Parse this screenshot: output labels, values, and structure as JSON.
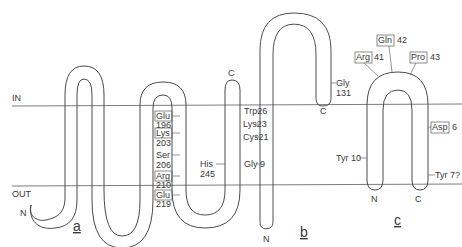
{
  "membrane": {
    "in_label": "IN",
    "out_label": "OUT"
  },
  "topology_a": {
    "panel_label": "a",
    "n_term": "N",
    "c_term": "C",
    "residues": [
      {
        "name": "Glu",
        "num": "196",
        "boxed": true
      },
      {
        "name": "Lys",
        "num": "203",
        "boxed": true
      },
      {
        "name": "Ser",
        "num": "206",
        "boxed": false
      },
      {
        "name": "Arg",
        "num": "210",
        "boxed": true
      },
      {
        "name": "Glu",
        "num": "219",
        "boxed": true
      },
      {
        "name": "His",
        "num": "245",
        "boxed": false
      }
    ]
  },
  "topology_b": {
    "panel_label": "b",
    "n_term": "N",
    "c_term": "C",
    "residues": [
      {
        "name": "Trp",
        "num": "26"
      },
      {
        "name": "Lys",
        "num": "23"
      },
      {
        "name": "Cys",
        "num": "21"
      },
      {
        "name": "Gly",
        "num": "9"
      },
      {
        "name": "Gly",
        "num": "131"
      }
    ]
  },
  "topology_c": {
    "panel_label": "c",
    "n_term": "N",
    "c_term": "C",
    "residues": [
      {
        "name": "Arg",
        "num": "41",
        "boxed": true
      },
      {
        "name": "Gln",
        "num": "42",
        "boxed": true
      },
      {
        "name": "Pro",
        "num": "43",
        "boxed": true
      },
      {
        "name": "Asp",
        "num": "6",
        "boxed": true
      },
      {
        "name": "Tyr",
        "num": "10",
        "boxed": false
      },
      {
        "name": "Tyr",
        "num": "7?",
        "boxed": false
      }
    ]
  }
}
